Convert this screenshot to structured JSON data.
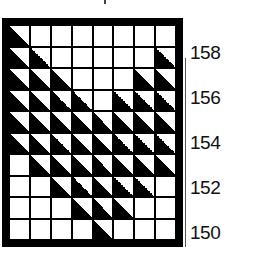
{
  "chart_data": {
    "type": "heatmap",
    "title": "",
    "columns": 8,
    "rows": 10,
    "cells": [
      [
        1,
        0,
        0,
        0,
        0,
        0,
        0,
        0
      ],
      [
        1,
        1,
        0,
        0,
        0,
        0,
        0,
        1
      ],
      [
        1,
        1,
        1,
        0,
        0,
        0,
        1,
        1
      ],
      [
        1,
        1,
        1,
        1,
        0,
        1,
        1,
        1
      ],
      [
        1,
        1,
        1,
        1,
        1,
        1,
        1,
        1
      ],
      [
        1,
        1,
        1,
        1,
        1,
        1,
        1,
        1
      ],
      [
        0,
        1,
        1,
        1,
        1,
        1,
        1,
        1
      ],
      [
        0,
        0,
        1,
        1,
        1,
        1,
        1,
        0
      ],
      [
        0,
        0,
        0,
        1,
        1,
        1,
        0,
        0
      ],
      [
        0,
        0,
        0,
        0,
        1,
        0,
        0,
        0
      ]
    ],
    "row_labels": [
      {
        "row": 1,
        "label": "158"
      },
      {
        "row": 3,
        "label": "156"
      },
      {
        "row": 5,
        "label": "154"
      },
      {
        "row": 7,
        "label": "152"
      },
      {
        "row": 9,
        "label": "150"
      }
    ],
    "colors": {
      "fill": "#000000",
      "background": "#ffffff",
      "grid": "#000000"
    }
  },
  "labels": [
    "158",
    "156",
    "154",
    "152",
    "150"
  ]
}
